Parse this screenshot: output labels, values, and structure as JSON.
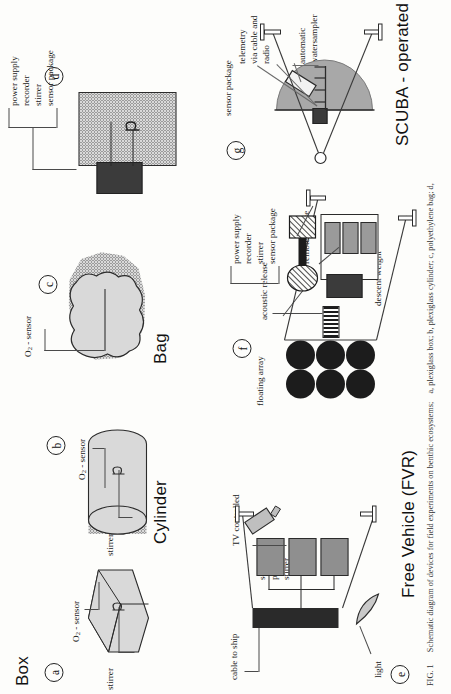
{
  "figure": {
    "number": "FIG. 1",
    "caption_line1": "Schematic diagram of devices for field experiments on benthic ecosystems;",
    "caption_line2": "a, plexiglass box; b, plexiglass cylinder; c, polyethylene bag; d,"
  },
  "headings": {
    "box": "Box",
    "cylinder": "Cylinder",
    "bag": "Bag",
    "scuba": "SCUBA - operated",
    "free_vehicle": "Free Vehicle (FVR)"
  },
  "panels": {
    "a": {
      "tag": "a",
      "labels": {
        "stirrer": "stirrer",
        "sensor": "O2 - sensor"
      }
    },
    "b": {
      "tag": "b",
      "labels": {
        "stirrer": "stirrer",
        "sensor": "O2 - sensor"
      }
    },
    "c": {
      "tag": "c",
      "labels": {
        "sensor": "O2 - sensor"
      }
    },
    "d": {
      "tag": "d",
      "labels": {
        "power_supply": "power supply",
        "recorder": "recorder",
        "stirrer": "stirrer",
        "sensor_package": "sensor package"
      }
    },
    "e": {
      "tag": "e",
      "labels": {
        "cable_to_ship": "cable to ship",
        "tv_controlled": "TV controlled",
        "sensor": "sensor",
        "package": "package",
        "stirrer": "stirrer",
        "light": "light"
      }
    },
    "f": {
      "tag": "f",
      "labels": {
        "floating_array": "floating array",
        "acoustic_release": "acoustic release",
        "power_supply": "power supply",
        "recorder": "recorder",
        "stirrer": "stirrer",
        "sensor_package": "sensor package",
        "remote_release": "remote release",
        "descent_weight": "descent weight"
      }
    },
    "g": {
      "tag": "g",
      "labels": {
        "sensor_package": "sensor package",
        "telemetry": "telemetry",
        "via_cable_and": "via cable and",
        "radio": "radio",
        "automatic": "automatic",
        "watersampler": "watersampler"
      }
    }
  },
  "colors": {
    "ink": "#1a1a1a",
    "dotted_fill": "#d9d9d9",
    "dark_block": "#3b3b3b",
    "dome_gray": "#a8a8a8",
    "mid_gray": "#8f8f8f",
    "paper": "#fdfdfb"
  }
}
